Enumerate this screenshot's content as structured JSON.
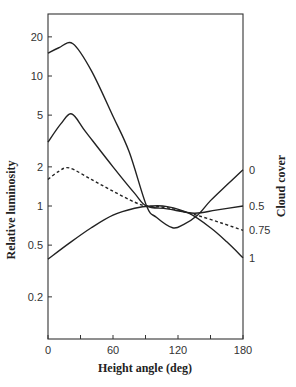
{
  "chart_data": {
    "type": "line",
    "title": "",
    "xlabel": "Height angle (deg)",
    "ylabel": "Relative luminosity",
    "right_label": "Cloud cover",
    "xlim": [
      0,
      180
    ],
    "ylim": [
      0.095,
      30
    ],
    "yscale": "log",
    "grid": false,
    "legend_position": "right (labels at line ends)",
    "x_ticks": [
      0,
      30,
      60,
      90,
      120,
      150,
      180
    ],
    "x_tick_labels": [
      "0",
      "",
      "60",
      "",
      "120",
      "",
      "180"
    ],
    "y_ticks": [
      0.2,
      0.5,
      1,
      2,
      5,
      10,
      20
    ],
    "y_tick_labels": [
      "0.2",
      "0.5",
      "1",
      "2",
      "5",
      "10",
      "20"
    ],
    "series": [
      {
        "name": "0",
        "style": "solid",
        "x": [
          0,
          10,
          23,
          40,
          60,
          75,
          91,
          100,
          115,
          125,
          138,
          150,
          165,
          180
        ],
        "values": [
          15,
          16.5,
          17.7,
          11,
          4.9,
          2.6,
          1.0,
          0.82,
          0.68,
          0.72,
          0.85,
          1.1,
          1.45,
          1.9
        ]
      },
      {
        "name": "0.5",
        "style": "solid",
        "x": [
          0,
          12,
          22,
          35,
          60,
          80,
          91,
          110,
          135,
          155,
          180
        ],
        "values": [
          3.1,
          4.3,
          5.1,
          3.7,
          2.0,
          1.25,
          1.0,
          0.95,
          0.88,
          0.93,
          1.0
        ]
      },
      {
        "name": "0.75",
        "style": "dashed",
        "x": [
          0,
          10,
          20,
          40,
          60,
          80,
          91,
          110,
          135,
          160,
          180
        ],
        "values": [
          1.6,
          1.85,
          1.96,
          1.6,
          1.3,
          1.07,
          1.0,
          0.97,
          0.86,
          0.74,
          0.65
        ]
      },
      {
        "name": "1",
        "style": "solid",
        "x": [
          0,
          20,
          40,
          60,
          80,
          95,
          110,
          130,
          150,
          165,
          180
        ],
        "values": [
          0.39,
          0.52,
          0.68,
          0.85,
          0.96,
          1.0,
          0.99,
          0.88,
          0.68,
          0.53,
          0.4
        ]
      }
    ]
  }
}
